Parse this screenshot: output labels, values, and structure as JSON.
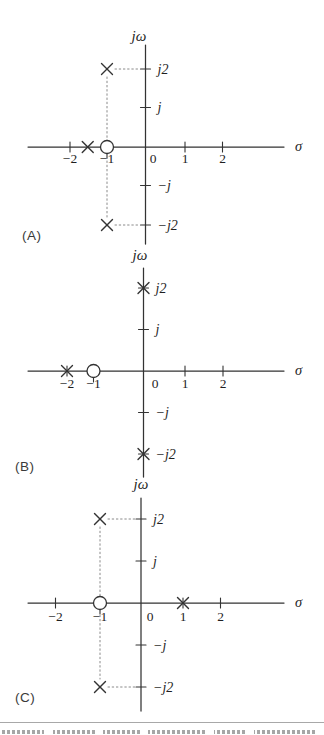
{
  "figure": {
    "kind": "s-plane pole-zero plots",
    "panel_count": 3
  },
  "colors": {
    "ink": "#333333",
    "text": "#1f1f1f",
    "guide": "#8a8a8a",
    "caption_rule": "#a8a8a8",
    "background": "#ffffff"
  },
  "chart_data": [
    {
      "id": "A",
      "type": "pole-zero",
      "panel_label": "(A)",
      "xlabel": "σ",
      "ylabel": "jω",
      "origin_label": "0",
      "x_ticks": [
        {
          "v": -2,
          "label": "−2"
        },
        {
          "v": -1,
          "label": "−1"
        },
        {
          "v": 1,
          "label": "1"
        },
        {
          "v": 2,
          "label": "2"
        }
      ],
      "y_ticks": [
        {
          "v": 2,
          "label": "j2"
        },
        {
          "v": 1,
          "label": "j"
        },
        {
          "v": -1,
          "label": "−j"
        },
        {
          "v": -2,
          "label": "−j2"
        }
      ],
      "poles": [
        {
          "re": -1,
          "im": 2
        },
        {
          "re": -1,
          "im": -2
        },
        {
          "re": -1.5,
          "im": 0
        }
      ],
      "zeros": [
        {
          "re": -1,
          "im": 0
        }
      ],
      "guides": [
        {
          "from": {
            "re": -1,
            "im": 2
          },
          "to": {
            "re": 0,
            "im": 2
          }
        },
        {
          "from": {
            "re": -1,
            "im": -2
          },
          "to": {
            "re": 0,
            "im": -2
          }
        },
        {
          "from": {
            "re": -1,
            "im": 2
          },
          "to": {
            "re": -1,
            "im": -2
          }
        }
      ]
    },
    {
      "id": "B",
      "type": "pole-zero",
      "panel_label": "(B)",
      "xlabel": "σ",
      "ylabel": "jω",
      "origin_label": "0",
      "x_ticks": [
        {
          "v": -2,
          "label": "−2"
        },
        {
          "v": -1,
          "label": "−1"
        },
        {
          "v": 1,
          "label": "1"
        },
        {
          "v": 2,
          "label": "2"
        }
      ],
      "y_ticks": [
        {
          "v": 2,
          "label": "j2"
        },
        {
          "v": 1,
          "label": "j"
        },
        {
          "v": -1,
          "label": "−j"
        },
        {
          "v": -2,
          "label": "−j2"
        }
      ],
      "poles": [
        {
          "re": 0,
          "im": 2
        },
        {
          "re": 0,
          "im": -2
        },
        {
          "re": -2,
          "im": 0
        }
      ],
      "zeros": [
        {
          "re": -1,
          "im": 0
        }
      ],
      "guides": []
    },
    {
      "id": "C",
      "type": "pole-zero",
      "panel_label": "(C)",
      "xlabel": "σ",
      "ylabel": "jω",
      "origin_label": "0",
      "x_ticks": [
        {
          "v": -2,
          "label": "−2"
        },
        {
          "v": -1,
          "label": "−1"
        },
        {
          "v": 1,
          "label": "1"
        },
        {
          "v": 2,
          "label": "2"
        }
      ],
      "y_ticks": [
        {
          "v": 2,
          "label": "j2"
        },
        {
          "v": 1,
          "label": "j"
        },
        {
          "v": -1,
          "label": "−j"
        },
        {
          "v": -2,
          "label": "−j2"
        }
      ],
      "poles": [
        {
          "re": -1,
          "im": 2
        },
        {
          "re": -1,
          "im": -2
        },
        {
          "re": 1,
          "im": 0
        }
      ],
      "zeros": [
        {
          "re": -1,
          "im": 0
        }
      ],
      "guides": [
        {
          "from": {
            "re": -1,
            "im": 2
          },
          "to": {
            "re": 0,
            "im": 2
          }
        },
        {
          "from": {
            "re": -1,
            "im": -2
          },
          "to": {
            "re": 0,
            "im": -2
          }
        },
        {
          "from": {
            "re": -1,
            "im": 2
          },
          "to": {
            "re": -1,
            "im": -2
          }
        }
      ]
    }
  ]
}
